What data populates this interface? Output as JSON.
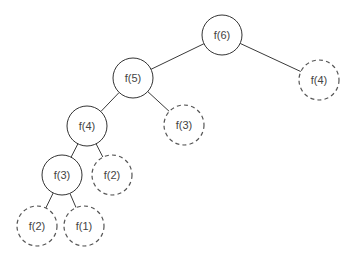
{
  "diagram": {
    "type": "recursion-tree",
    "nodes": [
      {
        "id": "n6",
        "label": "f(6)",
        "style": "solid"
      },
      {
        "id": "n5",
        "label": "f(5)",
        "style": "solid"
      },
      {
        "id": "n4r",
        "label": "f(4)",
        "style": "dashed"
      },
      {
        "id": "n4",
        "label": "f(4)",
        "style": "solid"
      },
      {
        "id": "n3r",
        "label": "f(3)",
        "style": "dashed"
      },
      {
        "id": "n3",
        "label": "f(3)",
        "style": "solid"
      },
      {
        "id": "n2r",
        "label": "f(2)",
        "style": "dashed"
      },
      {
        "id": "n2",
        "label": "f(2)",
        "style": "dashed"
      },
      {
        "id": "n1",
        "label": "f(1)",
        "style": "dashed"
      }
    ],
    "edges": [
      [
        "n6",
        "n5"
      ],
      [
        "n6",
        "n4r"
      ],
      [
        "n5",
        "n4"
      ],
      [
        "n5",
        "n3r"
      ],
      [
        "n4",
        "n3"
      ],
      [
        "n4",
        "n2r"
      ],
      [
        "n3",
        "n2"
      ],
      [
        "n3",
        "n1"
      ]
    ]
  }
}
